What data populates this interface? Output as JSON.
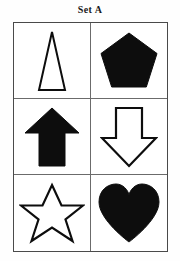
{
  "title": "Set A",
  "colors": {
    "fill_solid": "#0d0d0d",
    "fill_hollow": "#ffffff",
    "stroke": "#0d0d0d",
    "grid_border": "#4a4a4a",
    "grid_divider": "#6b6b6b",
    "background": "#ffffff"
  },
  "grid": {
    "columns": 2,
    "rows": 3,
    "cells": [
      {
        "position": "row1-col1",
        "shape": "triangle",
        "shape_label": "triangle",
        "fill": "hollow",
        "icon_name": "triangle-outline-icon"
      },
      {
        "position": "row1-col2",
        "shape": "pentagon",
        "shape_label": "pentagon",
        "fill": "solid",
        "icon_name": "pentagon-solid-icon"
      },
      {
        "position": "row2-col1",
        "shape": "arrow-up",
        "shape_label": "up arrow",
        "fill": "solid",
        "icon_name": "arrow-up-solid-icon"
      },
      {
        "position": "row2-col2",
        "shape": "arrow-down",
        "shape_label": "down arrow",
        "fill": "hollow",
        "icon_name": "arrow-down-outline-icon"
      },
      {
        "position": "row3-col1",
        "shape": "star",
        "shape_label": "five-pointed star",
        "fill": "hollow",
        "icon_name": "star-outline-icon"
      },
      {
        "position": "row3-col2",
        "shape": "heart",
        "shape_label": "heart",
        "fill": "solid",
        "icon_name": "heart-solid-icon"
      }
    ]
  }
}
